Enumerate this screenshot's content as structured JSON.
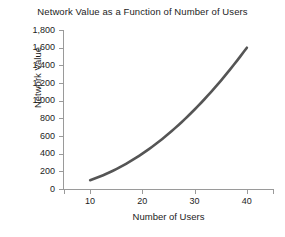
{
  "chart_data": {
    "type": "line",
    "title": "Network Value as a Function of Number of Users",
    "xlabel": "Number of Users",
    "ylabel": "Network Value",
    "x": [
      10,
      20,
      30,
      40
    ],
    "values": [
      100,
      400,
      900,
      1600
    ],
    "series": [
      {
        "name": "Network Value",
        "values": [
          100,
          400,
          900,
          1600
        ]
      }
    ],
    "xlim": [
      5,
      45
    ],
    "ylim": [
      0,
      1800
    ],
    "xticks": [
      10,
      20,
      30,
      40
    ],
    "xtick_labels": [
      "10",
      "20",
      "30",
      "40"
    ],
    "yticks": [
      0,
      200,
      400,
      600,
      800,
      1000,
      1200,
      1400,
      1600,
      1800
    ],
    "ytick_labels": [
      "0",
      "200",
      "400",
      "600",
      "800",
      "1,000",
      "1,200",
      "1,400",
      "1,600",
      "1,800"
    ],
    "grid": false,
    "legend": false,
    "legend_position": "none",
    "line_color": "#555555",
    "line_width": 2.6,
    "axis_color": "#9a9a9a",
    "background_color": "#ffffff",
    "annotations": []
  }
}
